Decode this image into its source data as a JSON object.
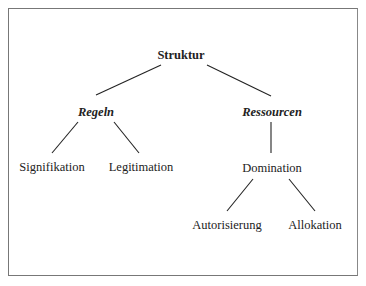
{
  "diagram": {
    "type": "tree",
    "root": {
      "label": "Struktur",
      "children": [
        {
          "label": "Regeln",
          "children": [
            {
              "label": "Signifikation"
            },
            {
              "label": "Legitimation"
            }
          ]
        },
        {
          "label": "Ressourcen",
          "children": [
            {
              "label": "Domination",
              "children": [
                {
                  "label": "Autorisierung"
                },
                {
                  "label": "Allokation"
                }
              ]
            }
          ]
        }
      ]
    }
  },
  "nodes": {
    "struktur": "Struktur",
    "regeln": "Regeln",
    "ressourcen": "Ressourcen",
    "signifikation": "Signifikation",
    "legitimation": "Legitimation",
    "domination": "Domination",
    "autorisierung": "Autorisierung",
    "allokation": "Allokation"
  },
  "colors": {
    "line": "#222222",
    "border": "#777777"
  }
}
